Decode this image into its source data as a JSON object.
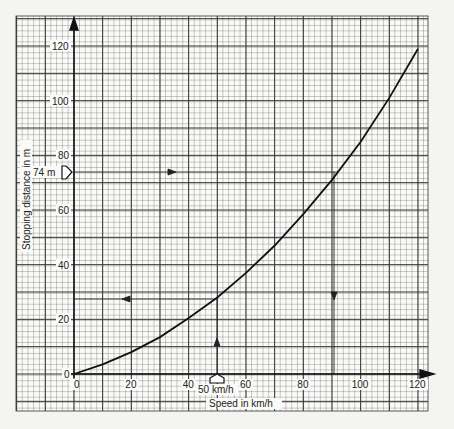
{
  "chart_data": {
    "type": "line",
    "title": "",
    "xlabel": "Speed in km/h",
    "ylabel": "Stopping distance in m",
    "xlim": [
      0,
      120
    ],
    "ylim": [
      0,
      120
    ],
    "x_ticks": [
      0,
      20,
      40,
      60,
      80,
      100,
      120
    ],
    "y_ticks": [
      0,
      20,
      40,
      60,
      80,
      100,
      120
    ],
    "grid": true,
    "legend": null,
    "series": [
      {
        "name": "Stopping distance",
        "x": [
          0,
          10,
          20,
          30,
          40,
          50,
          60,
          70,
          80,
          90,
          100,
          110,
          120
        ],
        "y": [
          0,
          3.5,
          8,
          13.5,
          20.5,
          28,
          37,
          47,
          58.5,
          71,
          85,
          101,
          119
        ]
      }
    ],
    "annotations": [
      {
        "label": "50 km/h",
        "type": "x-marker",
        "x": 50
      },
      {
        "label": "74 m",
        "type": "y-marker",
        "y": 74
      },
      {
        "type": "guide-line",
        "description": "Vertical arrow up from 50 km/h to curve, horizontal arrow left to y-axis at ~28 m",
        "points": [
          [
            50,
            0
          ],
          [
            50,
            28
          ],
          [
            0,
            28
          ]
        ]
      },
      {
        "type": "guide-line",
        "description": "Horizontal arrow right from 74 m to curve, vertical arrow down to x-axis at ~92 km/h",
        "points": [
          [
            0,
            74
          ],
          [
            92,
            74
          ],
          [
            92,
            0
          ]
        ]
      }
    ]
  },
  "labels": {
    "x_axis_title": "Speed in km/h",
    "y_axis_title": "Stopping distance in m",
    "x_marker": "50 km/h",
    "y_marker": "74 m",
    "x_ticks": [
      "0",
      "20",
      "40",
      "60",
      "80",
      "100",
      "120"
    ],
    "y_ticks": [
      "0",
      "20",
      "40",
      "60",
      "80",
      "100",
      "120"
    ]
  }
}
